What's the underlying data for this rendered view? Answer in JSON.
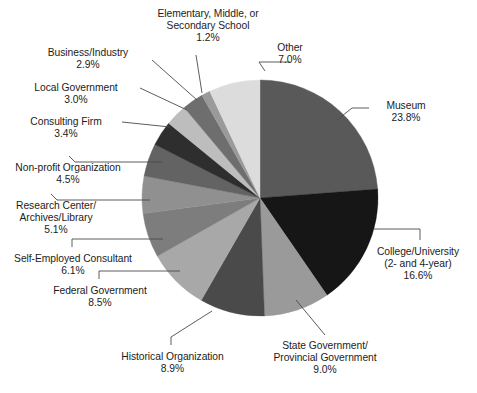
{
  "chart_data": {
    "type": "pie",
    "title": "",
    "subtitle": "",
    "xlabel": "",
    "ylabel": "",
    "legend_position": "none",
    "grid": false,
    "units": "percent",
    "start_angle_deg": 0,
    "direction": "clockwise",
    "categories": [
      "Museum",
      "College/University (2- and 4-year)",
      "State Government/Provincial Government",
      "Historical Organization",
      "Federal Government",
      "Self-Employed Consultant",
      "Research Center/Archives/Library",
      "Non-profit Organization",
      "Consulting Firm",
      "Local Government",
      "Business/Industry",
      "Elementary, Middle, or Secondary School",
      "Other"
    ],
    "values": [
      23.8,
      16.6,
      9.0,
      8.9,
      8.5,
      6.1,
      5.1,
      4.5,
      3.4,
      3.0,
      2.9,
      1.2,
      7.0
    ],
    "colors": [
      "#595959",
      "#161616",
      "#9a9a9a",
      "#4a4a4a",
      "#a8a8a8",
      "#7d7d7d",
      "#909090",
      "#636363",
      "#2e2e2e",
      "#bdbdbd",
      "#6e6e6e",
      "#9a9a9a",
      "#dcdcdc"
    ],
    "slices": [
      {
        "label": "Museum",
        "value": 23.8,
        "color": "#595959"
      },
      {
        "label": "College/University (2- and 4-year)",
        "value": 16.6,
        "color": "#161616"
      },
      {
        "label": "State Government/Provincial Government",
        "value": 9.0,
        "color": "#9a9a9a"
      },
      {
        "label": "Historical Organization",
        "value": 8.9,
        "color": "#4a4a4a"
      },
      {
        "label": "Federal Government",
        "value": 8.5,
        "color": "#a8a8a8"
      },
      {
        "label": "Self-Employed Consultant",
        "value": 6.1,
        "color": "#7d7d7d"
      },
      {
        "label": "Research Center/Archives/Library",
        "value": 5.1,
        "color": "#909090"
      },
      {
        "label": "Non-profit Organization",
        "value": 4.5,
        "color": "#636363"
      },
      {
        "label": "Consulting Firm",
        "value": 3.4,
        "color": "#2e2e2e"
      },
      {
        "label": "Local Government",
        "value": 3.0,
        "color": "#bdbdbd"
      },
      {
        "label": "Business/Industry",
        "value": 2.9,
        "color": "#6e6e6e"
      },
      {
        "label": "Elementary, Middle, or Secondary School",
        "value": 1.2,
        "color": "#9a9a9a"
      },
      {
        "label": "Other",
        "value": 7.0,
        "color": "#dcdcdc"
      }
    ]
  },
  "labels": {
    "elementary": {
      "line1": "Elementary, Middle, or",
      "line2": "Secondary School",
      "pct": "1.2%"
    },
    "business": {
      "line1": "Business/Industry",
      "pct": "2.9%"
    },
    "local_government": {
      "line1": "Local Government",
      "pct": "3.0%"
    },
    "consulting": {
      "line1": "Consulting Firm",
      "pct": "3.4%"
    },
    "nonprofit": {
      "line1": "Non-profit Organization",
      "pct": "4.5%"
    },
    "research_center": {
      "line1": "Research Center/",
      "line2": "Archives/Library",
      "pct": "5.1%"
    },
    "self_employed": {
      "line1": "Self-Employed Consultant",
      "pct": "6.1%"
    },
    "federal": {
      "line1": "Federal Government",
      "pct": "8.5%"
    },
    "historical": {
      "line1": "Historical Organization",
      "pct": "8.9%"
    },
    "state_government": {
      "line1": "State Government/",
      "line2": "Provincial Government",
      "pct": "9.0%"
    },
    "college": {
      "line1": "College/University",
      "line2": "(2- and 4-year)",
      "pct": "16.6%"
    },
    "museum": {
      "line1": "Museum",
      "pct": "23.8%"
    },
    "other": {
      "line1": "Other",
      "pct": "7.0%"
    }
  },
  "style": {
    "leader_color": "#4a4a4a",
    "background": "#ffffff",
    "text_color": "#1c1c1c"
  }
}
